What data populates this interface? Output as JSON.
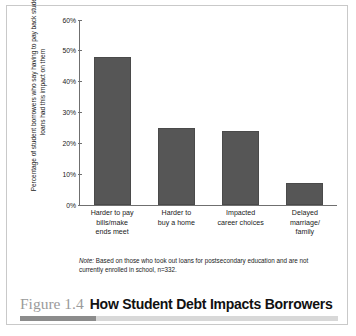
{
  "figure": {
    "number_label": "Figure 1.4",
    "title": "How Student Debt Impacts Borrowers"
  },
  "note": {
    "label": "Note:",
    "text": " Based on those who took out loans for postsecondary education and are not currently enrolled in school, n=332."
  },
  "colors": {
    "bar_fill": "#565656",
    "axis": "#6f6f6f",
    "rule_dark": "#8c8c8c",
    "rule_light": "#d8d8d8",
    "figure_number": "#9a9a9a",
    "border": "#c9c9c9"
  },
  "chart_data": {
    "type": "bar",
    "title": "How Student Debt Impacts Borrowers",
    "xlabel": "",
    "ylabel": "Percentage of student borrowers who say having to pay back student loans had this impact on them",
    "ylim": [
      0,
      60
    ],
    "ytick_labels": [
      "60%",
      "50%",
      "40%",
      "30%",
      "20%",
      "10%",
      "0%"
    ],
    "ytick_values": [
      60,
      50,
      40,
      30,
      20,
      10,
      0
    ],
    "grid": false,
    "legend": null,
    "categories": [
      "Harder to pay bills/make ends meet",
      "Harder to buy a home",
      "Impacted career choices",
      "Delayed marriage/family"
    ],
    "category_lines": [
      [
        "Harder to pay",
        "bills/make",
        "ends meet"
      ],
      [
        "Harder to",
        "buy a home"
      ],
      [
        "Impacted",
        "career choices"
      ],
      [
        "Delayed",
        "marriage/",
        "family"
      ]
    ],
    "values": [
      48,
      25,
      24,
      7
    ],
    "value_unit": "%",
    "annotation": "Note: Based on those who took out loans for postsecondary education and are not currently enrolled in school, n=332."
  }
}
